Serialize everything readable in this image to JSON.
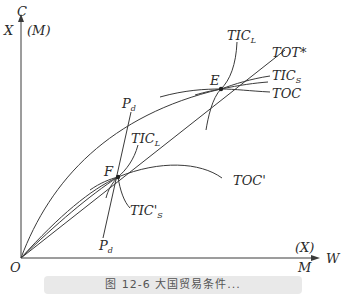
{
  "diagram": {
    "axes": {
      "y_label_top": "C",
      "y_label_left": "X",
      "y_label_right": "(M)",
      "x_label_upper": "(X)",
      "x_label_lower": "M",
      "x_label_right": "W",
      "origin": "O"
    },
    "points": {
      "E": "E",
      "F": "F"
    },
    "curves": {
      "tic_l_top": "TIC",
      "tic_l_top_sub": "L",
      "tot_star": "TOT*",
      "tic_s": "TIC",
      "tic_s_sub": "S",
      "toc": "TOC",
      "toc_prime": "TOC'",
      "tic_l_mid": "TIC",
      "tic_l_mid_sub": "L",
      "tic_s_prime": "TIC'",
      "tic_s_prime_sub": "S",
      "pd_top": "P",
      "pd_top_sub": "d",
      "pd_bottom": "P",
      "pd_bottom_sub": "d"
    }
  },
  "caption": "图 12-6  大国贸易条件..."
}
